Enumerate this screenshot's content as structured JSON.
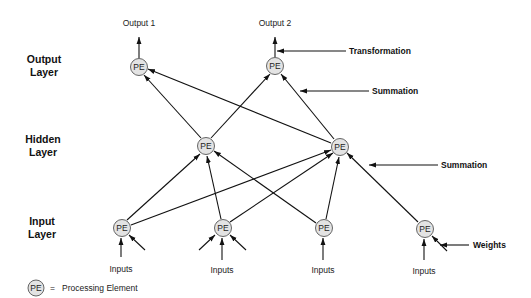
{
  "layers": {
    "output": [
      "Output",
      "Layer"
    ],
    "hidden": [
      "Hidden",
      "Layer"
    ],
    "input": [
      "Input",
      "Layer"
    ]
  },
  "outputs": [
    "Output 1",
    "Output 2"
  ],
  "inputs_label": "Inputs",
  "node_label": "PE",
  "annotations": {
    "transformation": "Transformation",
    "summation_top": "Summation",
    "summation_mid": "Summation",
    "weights": "Weights"
  },
  "legend": {
    "symbol": "PE",
    "equals": "=",
    "text": "Processing Element"
  },
  "nodes": {
    "output": [
      {
        "id": "o1",
        "x": 139,
        "y": 67
      },
      {
        "id": "o2",
        "x": 275,
        "y": 66
      }
    ],
    "hidden": [
      {
        "id": "h1",
        "x": 206,
        "y": 146
      },
      {
        "id": "h2",
        "x": 340,
        "y": 147
      }
    ],
    "input": [
      {
        "id": "i1",
        "x": 122,
        "y": 228
      },
      {
        "id": "i2",
        "x": 223,
        "y": 228
      },
      {
        "id": "i3",
        "x": 324,
        "y": 228
      },
      {
        "id": "i4",
        "x": 425,
        "y": 229
      }
    ]
  },
  "edges": [
    [
      "i1",
      "h1"
    ],
    [
      "i1",
      "h2"
    ],
    [
      "i2",
      "h1"
    ],
    [
      "i2",
      "h2"
    ],
    [
      "i3",
      "h1"
    ],
    [
      "i3",
      "h2"
    ],
    [
      "i4",
      "h2"
    ],
    [
      "h1",
      "o1"
    ],
    [
      "h1",
      "o2"
    ],
    [
      "h2",
      "o1"
    ],
    [
      "h2",
      "o2"
    ]
  ]
}
